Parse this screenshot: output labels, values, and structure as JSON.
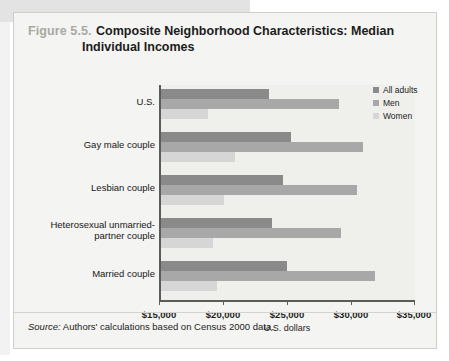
{
  "figure": {
    "number": "Figure 5.5.",
    "title_line1": "Composite Neighborhood Characteristics: Median",
    "title_line2": "Individual Incomes",
    "source_label": "Source:",
    "source_text": " Authors' calculations based on Census 2000 data."
  },
  "legend": {
    "items": [
      {
        "label": "All adults",
        "color": "#8a8a8a"
      },
      {
        "label": "Men",
        "color": "#a8a8a8"
      },
      {
        "label": "Women",
        "color": "#d6d6d6"
      }
    ]
  },
  "chart_data": {
    "type": "bar",
    "orientation": "horizontal",
    "title": "Composite Neighborhood Characteristics: Median Individual Incomes",
    "xlabel": "U.S. dollars",
    "ylabel": "",
    "xlim": [
      15000,
      35000
    ],
    "xticks": [
      15000,
      20000,
      25000,
      30000,
      35000
    ],
    "xticklabels": [
      "$15,000",
      "$20,000",
      "$25,000",
      "$30,000",
      "$35,000"
    ],
    "grid": false,
    "legend_position": "top-right",
    "categories": [
      "U.S.",
      "Gay male couple",
      "Lesbian couple",
      "Heterosexual unmarried-partner couple",
      "Married couple"
    ],
    "series": [
      {
        "name": "All adults",
        "color": "#8a8a8a",
        "values": [
          23600,
          25300,
          24700,
          23800,
          25000
        ]
      },
      {
        "name": "Men",
        "color": "#a8a8a8",
        "values": [
          29100,
          30900,
          30500,
          29200,
          31900
        ]
      },
      {
        "name": "Women",
        "color": "#d6d6d6",
        "values": [
          18800,
          20900,
          20100,
          19200,
          19500
        ]
      }
    ]
  }
}
